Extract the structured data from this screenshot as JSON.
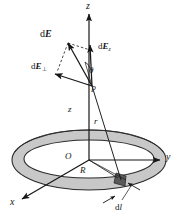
{
  "figure": {
    "kind": "physics-diagram",
    "background_color": "#ffffff",
    "line_color": "#161616",
    "ring_fill_color": "#c8c8c8",
    "ring_edge_color": "#333333",
    "element_fill_color": "#595959"
  },
  "axes": {
    "z_label": "z",
    "y_label": "y",
    "x_label": "x"
  },
  "points": {
    "origin_label": "O",
    "field_point_label": "P"
  },
  "vectors": {
    "total_field": {
      "d": "d",
      "symbol": "E"
    },
    "axial_component": {
      "d": "d",
      "symbol": "E",
      "subscript": "z"
    },
    "perp_component": {
      "d": "d",
      "symbol": "E",
      "subscript": "⊥"
    }
  },
  "angles": {
    "theta": "θ"
  },
  "distances": {
    "axial_height": "z",
    "source_to_point": "r",
    "ring_radius": "R"
  },
  "source_element": {
    "d": "d",
    "symbol": "l"
  }
}
